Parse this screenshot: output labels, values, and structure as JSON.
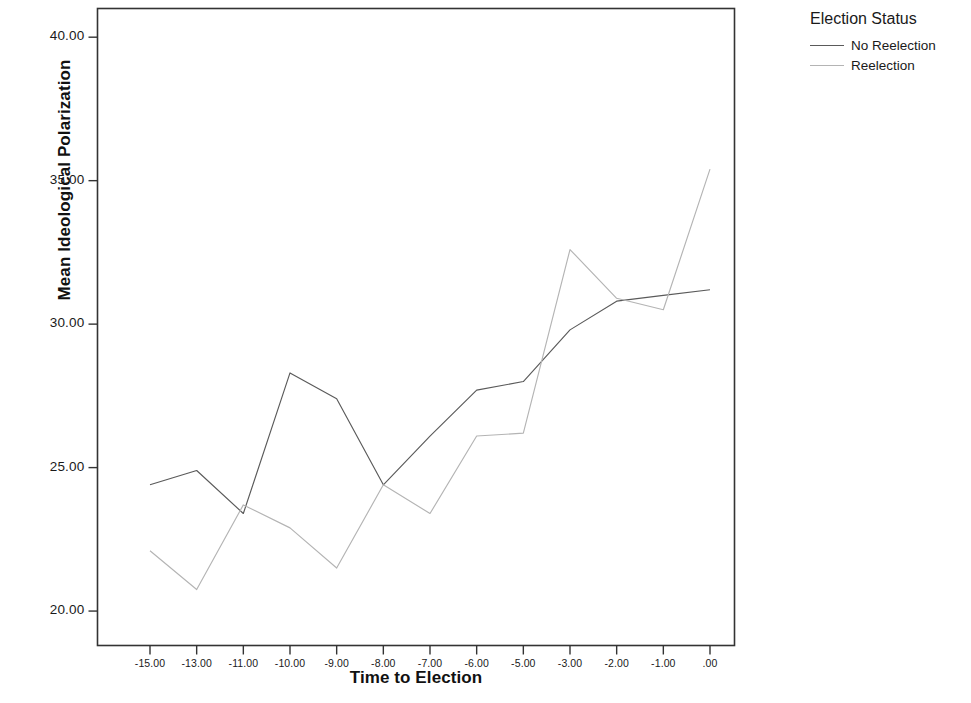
{
  "chart_data": {
    "type": "line",
    "title": "",
    "xlabel": "Time to Election",
    "ylabel": "Mean Ideological Polarization",
    "categories": [
      "-15.00",
      "-13.00",
      "-11.00",
      "-10.00",
      "-9.00",
      "-8.00",
      "-7.00",
      "-6.00",
      "-5.00",
      "-3.00",
      "-2.00",
      "-1.00",
      ".00"
    ],
    "x_tick_labels": [
      "-15.00",
      "-13.00",
      "-11.00",
      "-10.00",
      "-9.00",
      "-8.00",
      "-7.00",
      "-6.00",
      "-5.00",
      "-3.00",
      "-2.00",
      "-1.00",
      ".00"
    ],
    "y_tick_labels": [
      "20.00",
      "25.00",
      "30.00",
      "35.00",
      "40.00"
    ],
    "y_ticks": [
      20,
      25,
      30,
      35,
      40
    ],
    "ylim": [
      18.8,
      41.0
    ],
    "grid": false,
    "legend_position": "right",
    "legend_title": "Election Status",
    "series": [
      {
        "name": "No Reelection",
        "color": "#5a5a5a",
        "values": [
          24.4,
          24.9,
          23.4,
          28.3,
          27.4,
          24.4,
          26.1,
          27.7,
          28.0,
          29.8,
          30.8,
          31.0,
          31.2
        ]
      },
      {
        "name": "Reelection",
        "color": "#b4b4b4",
        "values": [
          22.1,
          20.75,
          23.7,
          22.9,
          21.5,
          24.4,
          23.4,
          26.1,
          26.2,
          32.6,
          30.9,
          30.5,
          35.4
        ]
      }
    ]
  },
  "legend": {
    "title": "Election Status",
    "entries": [
      {
        "label": "No Reelection",
        "color": "#5a5a5a"
      },
      {
        "label": "Reelection",
        "color": "#b4b4b4"
      }
    ]
  },
  "axes": {
    "x_title": "Time to Election",
    "y_title": "Mean Ideological Polarization"
  },
  "colors": {
    "frame": "#333333",
    "background": "#ffffff",
    "series_no_reelection": "#5a5a5a",
    "series_reelection": "#b4b4b4"
  }
}
